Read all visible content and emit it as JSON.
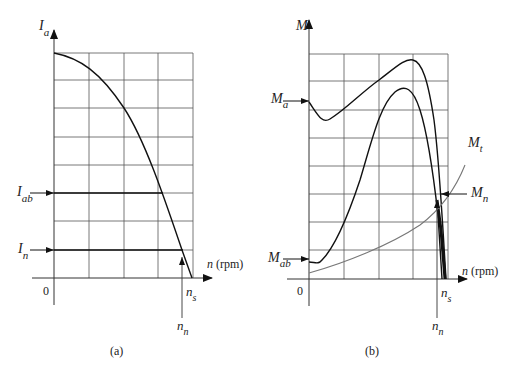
{
  "panels": [
    {
      "id": "a",
      "caption": "(a)",
      "y_axis_label": "I",
      "y_axis_sub": "a",
      "x_axis_label": "n",
      "x_axis_unit": "(rpm)",
      "origin_label": "0",
      "markers": {
        "I_ab": {
          "main": "I",
          "sub": "ab"
        },
        "I_n": {
          "main": "I",
          "sub": "n"
        },
        "n_s": {
          "main": "n",
          "sub": "s"
        },
        "n_n": {
          "main": "n",
          "sub": "n"
        }
      },
      "grid": {
        "columns": 4,
        "rows": 8
      }
    },
    {
      "id": "b",
      "caption": "(b)",
      "y_axis_label": "M",
      "x_axis_label": "n",
      "x_axis_unit": "(rpm)",
      "origin_label": "0",
      "markers": {
        "M_a": {
          "main": "M",
          "sub": "a"
        },
        "M_ab": {
          "main": "M",
          "sub": "ab"
        },
        "M_t": {
          "main": "M",
          "sub": "t"
        },
        "M_n": {
          "main": "M",
          "sub": "n"
        },
        "n_s": {
          "main": "n",
          "sub": "s"
        },
        "n_n": {
          "main": "n",
          "sub": "n"
        }
      },
      "grid": {
        "columns": 4,
        "rows": 8
      }
    }
  ],
  "colors": {
    "curve": "#111111",
    "grid": "#555555",
    "load_curve": "#777777"
  }
}
